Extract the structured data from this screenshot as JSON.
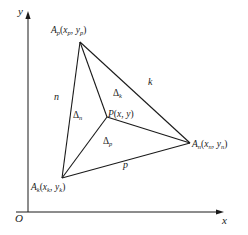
{
  "figure": {
    "type": "geometry-diagram",
    "background_color": "#ffffff",
    "line_color": "#1a1a1a",
    "text_color": "#1a1a1a"
  },
  "axes": {
    "y_label": "y",
    "x_label": "x",
    "origin_label": "O"
  },
  "vertices": [
    {
      "name": "vertex-top",
      "label_base": "A",
      "label_sub": "p",
      "coord_open": "(",
      "coord_x": "x",
      "coord_x_sub": "p",
      "coord_sep": ", ",
      "coord_y": "y",
      "coord_y_sub": "p",
      "coord_close": ")",
      "full_label": "Ap(xp, yp)"
    },
    {
      "name": "vertex-bottom-left",
      "label_base": "A",
      "label_sub": "k",
      "coord_open": "(",
      "coord_x": "x",
      "coord_x_sub": "k",
      "coord_sep": ", ",
      "coord_y": "y",
      "coord_y_sub": "k",
      "coord_close": ")",
      "full_label": "Ak(xk, yk)"
    },
    {
      "name": "vertex-right",
      "label_base": "A",
      "label_sub": "n",
      "coord_open": "(",
      "coord_x": "x",
      "coord_x_sub": "n",
      "coord_sep": ", ",
      "coord_y": "y",
      "coord_y_sub": "n",
      "coord_close": ")",
      "full_label": "An(xn, yn)"
    }
  ],
  "interior_point": {
    "label_base": "P",
    "coord_open": "(",
    "coord_x": "x",
    "coord_sep": ", ",
    "coord_y": "y",
    "coord_close": ")",
    "full_label": "P(x, y)"
  },
  "sub_areas": [
    {
      "name": "area-k",
      "symbol": "Δ",
      "subscript": "k",
      "full_label": "Δk"
    },
    {
      "name": "area-n",
      "symbol": "Δ",
      "subscript": "n",
      "full_label": "Δn"
    },
    {
      "name": "area-p",
      "symbol": "Δ",
      "subscript": "p",
      "full_label": "Δp"
    }
  ],
  "edges": [
    {
      "name": "edge-n",
      "label": "n"
    },
    {
      "name": "edge-k",
      "label": "k"
    },
    {
      "name": "edge-p",
      "label": "p"
    }
  ]
}
